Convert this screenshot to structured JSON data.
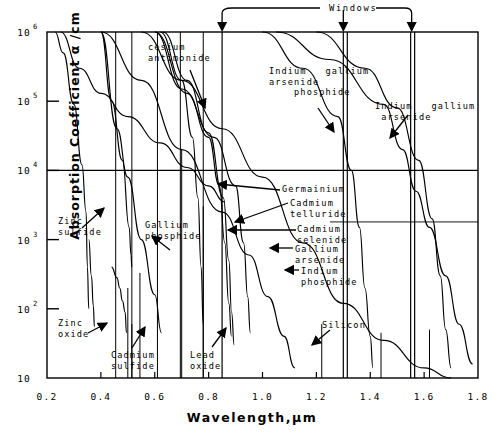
{
  "chart_data": {
    "type": "line",
    "title": "",
    "xlabel": "Wavelength,μm",
    "ylabel": "Absorption Coefficient  α /cm",
    "xlim": [
      0.2,
      1.8
    ],
    "ylim": [
      10,
      1000000
    ],
    "yscale": "log",
    "xscale": "linear",
    "grid": false,
    "xticks": [
      "0.2",
      "0.4",
      "0.6",
      "0.8",
      "1.0",
      "1.2",
      "1.4",
      "1.6",
      "1.8"
    ],
    "xtick_values": [
      0.2,
      0.4,
      0.6,
      0.8,
      1.0,
      1.2,
      1.4,
      1.6,
      1.8
    ],
    "ytick_labels": [
      "10",
      "10²",
      "10³",
      "10⁴",
      "10⁵",
      "10⁶"
    ],
    "ytick_mantissa": [
      "10",
      "10",
      "10",
      "10",
      "10",
      "10"
    ],
    "ytick_exponent": [
      "",
      "2",
      "3",
      "4",
      "5",
      "6"
    ],
    "ytick_values": [
      10,
      100,
      1000,
      10000,
      100000,
      1000000
    ],
    "windows_label": "Windows",
    "windows_wavelengths_um": [
      0.85,
      1.3,
      1.55
    ],
    "horizontal_reference_line_y": 10000,
    "series": [
      {
        "name": "Zinc sulfide",
        "points": [
          [
            0.23,
            1000000
          ],
          [
            0.26,
            500000
          ],
          [
            0.3,
            90000
          ],
          [
            0.33,
            12000
          ],
          [
            0.345,
            2500
          ],
          [
            0.35,
            400
          ],
          [
            0.355,
            100
          ]
        ]
      },
      {
        "name": "Zinc oxide",
        "points": [
          [
            0.355,
            1000
          ],
          [
            0.365,
            300
          ],
          [
            0.372,
            110
          ],
          [
            0.376,
            55
          ]
        ]
      },
      {
        "name": "Cadmium sulfide",
        "points": [
          [
            0.44,
            400
          ],
          [
            0.46,
            280
          ],
          [
            0.47,
            200
          ],
          [
            0.48,
            130
          ],
          [
            0.49,
            90
          ],
          [
            0.495,
            45
          ]
        ]
      },
      {
        "name": "Gallium phosphide",
        "points": [
          [
            0.4,
            1000000
          ],
          [
            0.44,
            100000
          ],
          [
            0.48,
            14000
          ],
          [
            0.505,
            1500
          ],
          [
            0.512,
            600
          ],
          [
            0.515,
            400
          ]
        ]
      },
      {
        "name": "Lead oxide",
        "points": [
          [
            0.4,
            1000000
          ],
          [
            0.46,
            40000
          ],
          [
            0.5,
            8000
          ],
          [
            0.55,
            1000
          ],
          [
            0.6,
            160
          ],
          [
            0.625,
            45
          ]
        ]
      },
      {
        "name": "cesium antimonide",
        "points": [
          [
            0.25,
            1000000
          ],
          [
            0.32,
            300000
          ],
          [
            0.4,
            130000
          ],
          [
            0.5,
            60000
          ],
          [
            0.62,
            25000
          ],
          [
            0.72,
            11000
          ],
          [
            0.8,
            6000
          ],
          [
            0.86,
            3500
          ]
        ]
      },
      {
        "name": "Germainium",
        "points": [
          [
            0.55,
            1000000
          ],
          [
            0.7,
            200000
          ],
          [
            0.85,
            40000
          ],
          [
            1.0,
            8000
          ],
          [
            1.15,
            900
          ],
          [
            1.3,
            120
          ],
          [
            1.45,
            35
          ],
          [
            1.6,
            14
          ],
          [
            1.7,
            10
          ]
        ]
      },
      {
        "name": "Cadmium telluride",
        "points": [
          [
            0.6,
            1000000
          ],
          [
            0.72,
            130000
          ],
          [
            0.8,
            30000
          ],
          [
            0.84,
            6000
          ],
          [
            0.86,
            900
          ],
          [
            0.875,
            120
          ],
          [
            0.885,
            40
          ]
        ]
      },
      {
        "name": "Cadmium selenide",
        "points": [
          [
            0.62,
            1000000
          ],
          [
            0.7,
            200000
          ],
          [
            0.74,
            30000
          ],
          [
            0.76,
            4000
          ],
          [
            0.772,
            400
          ],
          [
            0.78,
            60
          ]
        ]
      },
      {
        "name": "Gallium arsenide",
        "points": [
          [
            0.63,
            1000000
          ],
          [
            0.72,
            200000
          ],
          [
            0.8,
            35000
          ],
          [
            0.855,
            4000
          ],
          [
            0.875,
            500
          ],
          [
            0.885,
            90
          ],
          [
            0.895,
            30
          ]
        ]
      },
      {
        "name": "Indium phosphide",
        "points": [
          [
            0.6,
            1000000
          ],
          [
            0.7,
            150000
          ],
          [
            0.82,
            30000
          ],
          [
            0.9,
            6000
          ],
          [
            0.93,
            900
          ],
          [
            0.945,
            150
          ],
          [
            0.955,
            45
          ]
        ]
      },
      {
        "name": "Silicon",
        "points": [
          [
            0.4,
            1000000
          ],
          [
            0.55,
            200000
          ],
          [
            0.7,
            20000
          ],
          [
            0.85,
            2500
          ],
          [
            0.95,
            600
          ],
          [
            1.02,
            150
          ],
          [
            1.08,
            40
          ],
          [
            1.12,
            14
          ]
        ]
      },
      {
        "name": "Indium gallium arsenide phosphide",
        "points": [
          [
            1.0,
            1000000
          ],
          [
            1.15,
            300000
          ],
          [
            1.28,
            60000
          ],
          [
            1.33,
            10000
          ],
          [
            1.36,
            1500
          ],
          [
            1.38,
            200
          ],
          [
            1.4,
            40
          ],
          [
            1.41,
            14
          ]
        ]
      },
      {
        "name": "Indium gallium arsenide",
        "points": [
          [
            1.2,
            1000000
          ],
          [
            1.38,
            300000
          ],
          [
            1.5,
            80000
          ],
          [
            1.58,
            14000
          ],
          [
            1.63,
            2000
          ],
          [
            1.66,
            300
          ],
          [
            1.68,
            50
          ],
          [
            1.7,
            14
          ]
        ]
      },
      {
        "name": "Indium gallium arsenide long",
        "points": [
          [
            1.05,
            1000000
          ],
          [
            1.25,
            400000
          ],
          [
            1.45,
            90000
          ],
          [
            1.52,
            20000
          ],
          [
            1.57,
            5000
          ],
          [
            1.62,
            1500
          ],
          [
            1.68,
            300
          ],
          [
            1.73,
            60
          ],
          [
            1.78,
            16
          ]
        ]
      }
    ],
    "annotations": [
      {
        "label": "cesium\nantimonide",
        "name": "annotation-cesium-antimonide",
        "x": 148,
        "y": 42,
        "arrow": [
          [
            190,
            70
          ],
          [
            205,
            108
          ]
        ]
      },
      {
        "label": "Indium   gallium\narsenide\n    phosphide",
        "name": "annotation-indium-gallium-arsenide-phosphide",
        "x": 269,
        "y": 66,
        "arrow": [
          [
            318,
            108
          ],
          [
            334,
            132
          ]
        ]
      },
      {
        "label": "Indium   gallium\n arsenide",
        "name": "annotation-indium-gallium-arsenide",
        "x": 375,
        "y": 101,
        "arrow": [
          [
            408,
            115
          ],
          [
            390,
            138
          ]
        ]
      },
      {
        "label": "Zinc\nsulfide",
        "name": "annotation-zinc-sulfide",
        "x": 58,
        "y": 216,
        "arrow": [
          [
            82,
            228
          ],
          [
            104,
            208
          ]
        ]
      },
      {
        "label": "Zinc\noxide",
        "name": "annotation-zinc-oxide",
        "x": 58,
        "y": 318,
        "arrow": [
          [
            88,
            333
          ],
          [
            107,
            323
          ]
        ]
      },
      {
        "label": "Cadmium\nsulfide",
        "name": "annotation-cadmium-sulfide",
        "x": 111,
        "y": 350,
        "arrow": [
          [
            132,
            348
          ],
          [
            145,
            327
          ]
        ]
      },
      {
        "label": "Lead\noxide",
        "name": "annotation-lead-oxide",
        "x": 190,
        "y": 350,
        "arrow": [
          [
            212,
            347
          ],
          [
            226,
            328
          ]
        ]
      },
      {
        "label": "Gallium\nphosphide",
        "name": "annotation-gallium-phosphide",
        "x": 145,
        "y": 220,
        "arrow": [
          [
            170,
            250
          ],
          [
            152,
            236
          ]
        ]
      },
      {
        "label": "Germainium",
        "name": "annotation-germainium",
        "x": 282,
        "y": 184,
        "arrow": [
          [
            280,
            190
          ],
          [
            218,
            184
          ]
        ]
      },
      {
        "label": "Cadmium\ntelluride",
        "name": "annotation-cadmium-telluride",
        "x": 290,
        "y": 198,
        "arrow": [
          [
            288,
            203
          ],
          [
            235,
            222
          ]
        ]
      },
      {
        "label": "Cadmium\nselenide",
        "name": "annotation-cadmium-selenide",
        "x": 297,
        "y": 224,
        "arrow": [
          [
            296,
            230
          ],
          [
            228,
            230
          ]
        ]
      },
      {
        "label": "Gallium\narsenide",
        "name": "annotation-gallium-arsenide",
        "x": 295,
        "y": 244,
        "arrow": [
          [
            293,
            248
          ],
          [
            270,
            248
          ]
        ]
      },
      {
        "label": "Indium\nphosphide",
        "name": "annotation-indium-phosphide",
        "x": 301,
        "y": 266,
        "arrow": [
          [
            299,
            270
          ],
          [
            285,
            270
          ]
        ]
      },
      {
        "label": "Silicon",
        "name": "annotation-silicon",
        "x": 322,
        "y": 320,
        "arrow": [
          [
            330,
            330
          ],
          [
            312,
            345
          ]
        ]
      }
    ]
  }
}
